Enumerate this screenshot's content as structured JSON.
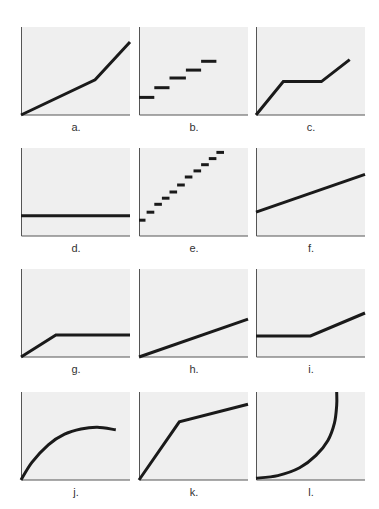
{
  "figure": {
    "background": "#ffffff",
    "panel_fill": "#efefef",
    "axis_color": "#555555",
    "line_color": "#1a1a1a"
  },
  "chart_data": [
    {
      "id": "a",
      "label": "a.",
      "type": "line",
      "description": "piecewise linear: gentle rise then steeper rise",
      "points": [
        [
          0,
          0
        ],
        [
          0.68,
          0.4
        ],
        [
          1,
          0.83
        ]
      ],
      "xlim": [
        0,
        1
      ],
      "ylim": [
        0,
        1
      ]
    },
    {
      "id": "b",
      "label": "b.",
      "type": "step",
      "description": "discrete horizontal steps rising (5 steps)",
      "segments": [
        [
          0,
          0.14,
          0.2
        ],
        [
          0.14,
          0.28,
          0.31
        ],
        [
          0.28,
          0.43,
          0.42
        ],
        [
          0.43,
          0.57,
          0.51
        ],
        [
          0.57,
          0.71,
          0.61
        ]
      ],
      "xlim": [
        0,
        1
      ],
      "ylim": [
        0,
        1
      ]
    },
    {
      "id": "c",
      "label": "c.",
      "type": "line",
      "description": "rise, flat plateau, rise",
      "points": [
        [
          0,
          0
        ],
        [
          0.25,
          0.38
        ],
        [
          0.6,
          0.38
        ],
        [
          0.86,
          0.63
        ]
      ],
      "xlim": [
        0,
        1
      ],
      "ylim": [
        0,
        1
      ]
    },
    {
      "id": "d",
      "label": "d.",
      "type": "line",
      "description": "constant horizontal line",
      "points": [
        [
          0,
          0.23
        ],
        [
          1,
          0.23
        ]
      ],
      "xlim": [
        0,
        1
      ],
      "ylim": [
        0,
        1
      ]
    },
    {
      "id": "e",
      "label": "e.",
      "type": "step",
      "description": "many small steps rising (11 steps)",
      "segments": [
        [
          0,
          0.06,
          0.18
        ],
        [
          0.07,
          0.14,
          0.27
        ],
        [
          0.14,
          0.21,
          0.36
        ],
        [
          0.21,
          0.28,
          0.43
        ],
        [
          0.28,
          0.35,
          0.5
        ],
        [
          0.35,
          0.42,
          0.58
        ],
        [
          0.42,
          0.49,
          0.67
        ],
        [
          0.5,
          0.57,
          0.74
        ],
        [
          0.57,
          0.64,
          0.81
        ],
        [
          0.64,
          0.71,
          0.88
        ],
        [
          0.71,
          0.78,
          0.95
        ]
      ],
      "xlim": [
        0,
        1
      ],
      "ylim": [
        0,
        1
      ]
    },
    {
      "id": "f",
      "label": "f.",
      "type": "line",
      "description": "straight line with positive intercept",
      "points": [
        [
          0,
          0.27
        ],
        [
          1,
          0.7
        ]
      ],
      "xlim": [
        0,
        1
      ],
      "ylim": [
        0,
        1
      ]
    },
    {
      "id": "g",
      "label": "g.",
      "type": "line",
      "description": "rise then flat",
      "points": [
        [
          0,
          0
        ],
        [
          0.32,
          0.25
        ],
        [
          1,
          0.25
        ]
      ],
      "xlim": [
        0,
        1
      ],
      "ylim": [
        0,
        1
      ]
    },
    {
      "id": "h",
      "label": "h.",
      "type": "line",
      "description": "straight line through origin",
      "points": [
        [
          0,
          0
        ],
        [
          1,
          0.43
        ]
      ],
      "xlim": [
        0,
        1
      ],
      "ylim": [
        0,
        1
      ]
    },
    {
      "id": "i",
      "label": "i.",
      "type": "line",
      "description": "flat then rise",
      "points": [
        [
          0,
          0.24
        ],
        [
          0.5,
          0.24
        ],
        [
          1,
          0.5
        ]
      ],
      "xlim": [
        0,
        1
      ],
      "ylim": [
        0,
        1
      ]
    },
    {
      "id": "j",
      "label": "j.",
      "type": "line",
      "description": "concave curve rising then leveling",
      "points": [
        [
          0,
          0
        ],
        [
          0.1,
          0.2
        ],
        [
          0.25,
          0.4
        ],
        [
          0.4,
          0.52
        ],
        [
          0.55,
          0.58
        ],
        [
          0.7,
          0.6
        ],
        [
          0.87,
          0.57
        ]
      ],
      "xlim": [
        0,
        1
      ],
      "ylim": [
        0,
        1
      ]
    },
    {
      "id": "k",
      "label": "k.",
      "type": "line",
      "description": "steep rise then gentle rise",
      "points": [
        [
          0,
          0
        ],
        [
          0.37,
          0.66
        ],
        [
          1,
          0.86
        ]
      ],
      "xlim": [
        0,
        1
      ],
      "ylim": [
        0,
        1
      ]
    },
    {
      "id": "l",
      "label": "l.",
      "type": "line",
      "description": "convex curve rising vertically (quarter ellipse)",
      "points": [
        [
          0,
          0.02
        ],
        [
          0.2,
          0.05
        ],
        [
          0.4,
          0.14
        ],
        [
          0.55,
          0.28
        ],
        [
          0.66,
          0.45
        ],
        [
          0.72,
          0.65
        ],
        [
          0.74,
          0.85
        ],
        [
          0.74,
          1
        ]
      ],
      "xlim": [
        0,
        1
      ],
      "ylim": [
        0,
        1
      ]
    }
  ],
  "panels_layout": {
    "cols_x": [
      21,
      139,
      256
    ],
    "rows_y": [
      27,
      148,
      269,
      392
    ],
    "box_w": 109,
    "box_h": 88
  }
}
